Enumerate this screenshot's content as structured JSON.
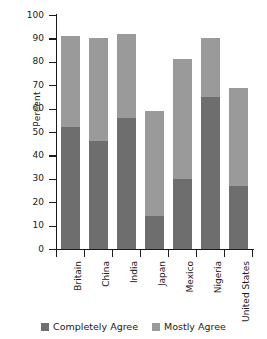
{
  "chart_data": {
    "type": "bar",
    "subtype": "stacked-vertical",
    "title": "",
    "xlabel": "",
    "ylabel": "Percent",
    "ylim": [
      0,
      100
    ],
    "yticks": [
      0,
      10,
      20,
      30,
      40,
      50,
      60,
      70,
      80,
      90,
      100
    ],
    "ytick_labels": [
      "0",
      "10",
      "20",
      "30",
      "40",
      "50",
      "60",
      "70",
      "80",
      "90",
      "100"
    ],
    "grid": false,
    "legend_position": "bottom",
    "categories": [
      "Britain",
      "China",
      "India",
      "Japan",
      "Mexico",
      "Nigeria",
      "United States"
    ],
    "series": [
      {
        "name": "Completely Agree",
        "color": "#6e6e6e",
        "values": [
          52,
          46,
          56,
          14,
          30,
          65,
          27
        ]
      },
      {
        "name": "Mostly Agree",
        "color": "#9a9a9a",
        "values": [
          39,
          44,
          36,
          45,
          51,
          25,
          42
        ]
      }
    ],
    "totals": [
      91,
      90,
      92,
      59,
      81,
      90,
      69
    ]
  },
  "legend": {
    "items": [
      {
        "label": "Completely Agree",
        "color": "#6e6e6e",
        "swatch_name": "legend-swatch-completely-agree"
      },
      {
        "label": "Mostly Agree",
        "color": "#9a9a9a",
        "swatch_name": "legend-swatch-mostly-agree"
      }
    ]
  },
  "axis": {
    "y_title": "Percent"
  }
}
